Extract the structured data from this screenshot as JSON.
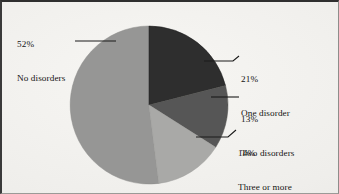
{
  "figure": {
    "background_color": "#f1f0ed",
    "border_color": "#2f2f2f",
    "width": 339,
    "height": 194
  },
  "chart_data": {
    "type": "pie",
    "title": "",
    "subtitle": "",
    "xlabel": "",
    "ylabel": "",
    "grid": false,
    "legend_position": "callout-labels",
    "units": "percent",
    "total": 100,
    "start_angle_deg": -90,
    "direction": "clockwise",
    "categories": [
      "No disorders",
      "One disorder",
      "Two disorders",
      "Three or more disorders"
    ],
    "values": [
      52,
      21,
      13,
      14
    ],
    "value_labels": [
      "52%",
      "21%",
      "13%",
      "14%"
    ],
    "colors": [
      "#969695",
      "#2d2d2d",
      "#575756",
      "#a9a9a7"
    ],
    "slices": [
      {
        "label": "No disorders",
        "value": 52,
        "value_label": "52%",
        "color": "#969695",
        "callout_lines": [
          "52%",
          "No disorders"
        ]
      },
      {
        "label": "One disorder",
        "value": 21,
        "value_label": "21%",
        "color": "#2d2d2d",
        "callout_lines": [
          "21%",
          "One disorder"
        ]
      },
      {
        "label": "Two disorders",
        "value": 13,
        "value_label": "13%",
        "color": "#575756",
        "callout_lines": [
          "13%",
          "Two disorders"
        ]
      },
      {
        "label": "Three or more disorders",
        "value": 14,
        "value_label": "14%",
        "color": "#a9a9a7",
        "callout_lines": [
          "14%",
          "Three or more",
          "disorders"
        ]
      }
    ]
  },
  "callouts": {
    "no_disorders": {
      "percent": "52%",
      "label": "No disorders"
    },
    "one_disorder": {
      "percent": "21%",
      "label": "One disorder"
    },
    "two_disorders": {
      "percent": "13%",
      "label": "Two disorders"
    },
    "three_or_more": {
      "percent": "14%",
      "label_line1": "Three or more",
      "label_line2": "disorders"
    }
  }
}
